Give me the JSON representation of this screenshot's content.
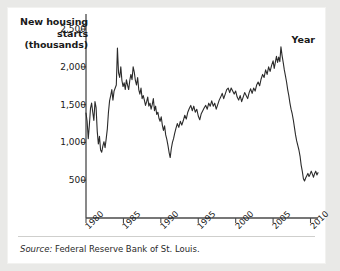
{
  "chart_data": {
    "type": "line",
    "title": "New housing starts (thousands)",
    "title_lines": [
      "New housing",
      "starts",
      "(thousands)"
    ],
    "xlabel": "Year",
    "ylabel": "New housing starts (thousands)",
    "xlim": [
      1980,
      2011
    ],
    "ylim": [
      0,
      2700
    ],
    "grid": false,
    "legend": null,
    "yticks": [
      500,
      1000,
      1500,
      2000,
      2500
    ],
    "ytick_labels": [
      "500",
      "1,000",
      "1,500",
      "2,000",
      "2,500"
    ],
    "xticks": [
      1980,
      1985,
      1990,
      1995,
      2000,
      2005,
      2010
    ],
    "xtick_labels": [
      "1980",
      "1985",
      "1990",
      "1995",
      "2000",
      "2005",
      "2010"
    ],
    "line_color": "#2b2b2b",
    "series": [
      {
        "name": "New housing starts",
        "x": [
          1980.0,
          1980.15,
          1980.3,
          1980.45,
          1980.6,
          1980.75,
          1980.9,
          1981.05,
          1981.2,
          1981.35,
          1981.5,
          1981.65,
          1981.8,
          1981.95,
          1982.1,
          1982.25,
          1982.4,
          1982.55,
          1982.7,
          1982.85,
          1983.0,
          1983.15,
          1983.3,
          1983.45,
          1983.6,
          1983.75,
          1983.9,
          1984.05,
          1984.2,
          1984.35,
          1984.5,
          1984.65,
          1984.8,
          1984.95,
          1985.1,
          1985.25,
          1985.4,
          1985.55,
          1985.7,
          1985.85,
          1986.0,
          1986.15,
          1986.3,
          1986.45,
          1986.6,
          1986.75,
          1986.9,
          1987.05,
          1987.2,
          1987.35,
          1987.5,
          1987.65,
          1987.8,
          1987.95,
          1988.1,
          1988.25,
          1988.4,
          1988.55,
          1988.7,
          1988.85,
          1989.0,
          1989.15,
          1989.3,
          1989.45,
          1989.6,
          1989.75,
          1989.9,
          1990.05,
          1990.2,
          1990.35,
          1990.5,
          1990.65,
          1990.8,
          1990.95,
          1991.1,
          1991.25,
          1991.4,
          1991.55,
          1991.7,
          1991.85,
          1992.0,
          1992.2,
          1992.4,
          1992.6,
          1992.8,
          1993.0,
          1993.2,
          1993.4,
          1993.6,
          1993.8,
          1994.0,
          1994.2,
          1994.4,
          1994.6,
          1994.8,
          1995.0,
          1995.2,
          1995.4,
          1995.6,
          1995.8,
          1996.0,
          1996.2,
          1996.4,
          1996.6,
          1996.8,
          1997.0,
          1997.2,
          1997.4,
          1997.6,
          1997.8,
          1998.0,
          1998.2,
          1998.4,
          1998.6,
          1998.8,
          1999.0,
          1999.2,
          1999.4,
          1999.6,
          1999.8,
          2000.0,
          2000.2,
          2000.4,
          2000.6,
          2000.8,
          2001.0,
          2001.2,
          2001.4,
          2001.6,
          2001.8,
          2002.0,
          2002.2,
          2002.4,
          2002.6,
          2002.8,
          2003.0,
          2003.2,
          2003.4,
          2003.6,
          2003.8,
          2004.0,
          2004.2,
          2004.4,
          2004.6,
          2004.8,
          2005.0,
          2005.15,
          2005.3,
          2005.45,
          2005.6,
          2005.75,
          2005.9,
          2006.05,
          2006.2,
          2006.35,
          2006.5,
          2006.65,
          2006.8,
          2006.95,
          2007.1,
          2007.25,
          2007.4,
          2007.55,
          2007.7,
          2007.85,
          2008.0,
          2008.15,
          2008.3,
          2008.45,
          2008.6,
          2008.75,
          2008.9,
          2009.05,
          2009.2,
          2009.35,
          2009.5,
          2009.65,
          2009.8,
          2009.95,
          2010.1,
          2010.25,
          2010.4,
          2010.55,
          2010.7,
          2010.85,
          2011.0
        ],
        "y": [
          1390,
          1280,
          1050,
          1230,
          1450,
          1520,
          1400,
          1290,
          1540,
          1460,
          1150,
          980,
          1080,
          900,
          870,
          950,
          1010,
          930,
          1050,
          1180,
          1400,
          1550,
          1620,
          1700,
          1560,
          1680,
          1720,
          1760,
          2250,
          1920,
          1860,
          2000,
          1820,
          1740,
          1790,
          1700,
          1830,
          1760,
          1700,
          1820,
          1900,
          1830,
          2000,
          1930,
          1820,
          1760,
          1860,
          1700,
          1640,
          1720,
          1580,
          1620,
          1560,
          1490,
          1540,
          1600,
          1480,
          1520,
          1440,
          1500,
          1580,
          1420,
          1480,
          1370,
          1400,
          1320,
          1280,
          1340,
          1230,
          1160,
          1220,
          1100,
          1040,
          960,
          870,
          800,
          920,
          1000,
          1050,
          1120,
          1180,
          1250,
          1200,
          1280,
          1230,
          1290,
          1360,
          1310,
          1400,
          1450,
          1490,
          1420,
          1480,
          1400,
          1440,
          1350,
          1300,
          1380,
          1420,
          1460,
          1490,
          1440,
          1520,
          1480,
          1550,
          1480,
          1520,
          1440,
          1500,
          1560,
          1600,
          1650,
          1580,
          1640,
          1700,
          1720,
          1660,
          1720,
          1680,
          1640,
          1680,
          1600,
          1560,
          1620,
          1540,
          1600,
          1660,
          1620,
          1580,
          1660,
          1710,
          1650,
          1720,
          1680,
          1760,
          1800,
          1750,
          1840,
          1900,
          1860,
          1960,
          1900,
          2000,
          1940,
          2020,
          2080,
          1980,
          2060,
          2140,
          2060,
          2130,
          2070,
          2265,
          2150,
          2060,
          1960,
          1880,
          1800,
          1700,
          1620,
          1520,
          1440,
          1380,
          1300,
          1200,
          1100,
          1020,
          960,
          900,
          820,
          700,
          620,
          520,
          490,
          530,
          560,
          590,
          550,
          580,
          620,
          580,
          540,
          590,
          620,
          570,
          600
        ]
      }
    ]
  },
  "source": {
    "prefix": "Source:",
    "text": "Federal Reserve Bank of St. Louis."
  }
}
